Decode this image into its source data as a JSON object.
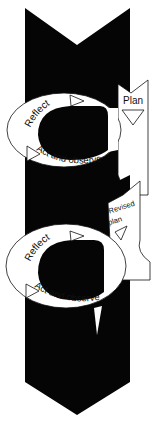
{
  "diagram": {
    "type": "action-research-spiral",
    "colors": {
      "arrow": "#050505",
      "loop_fill": "#ffffff",
      "stroke": "#111111"
    },
    "cycle1": {
      "reflect_label": "Reflect",
      "act_label": "Act and observe",
      "plan_label": "Plan"
    },
    "cycle2": {
      "reflect_label": "Reflect",
      "act_label": "Act and observe",
      "plan_label_line1": "Revised",
      "plan_label_line2": "plan"
    }
  }
}
